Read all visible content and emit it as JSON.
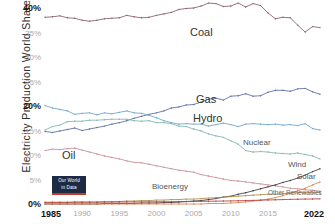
{
  "axes": {
    "ytitle": "Electricity Production World Share",
    "yticks": [
      {
        "label": "40%",
        "value": 40,
        "strong": true
      },
      {
        "label": "35%",
        "value": 35,
        "strong": false
      },
      {
        "label": "30%",
        "value": 30,
        "strong": false
      },
      {
        "label": "25%",
        "value": 25,
        "strong": false
      },
      {
        "label": "20%",
        "value": 20,
        "strong": true
      },
      {
        "label": "15%",
        "value": 15,
        "strong": false
      },
      {
        "label": "10%",
        "value": 10,
        "strong": false
      },
      {
        "label": "5%",
        "value": 5,
        "strong": false
      },
      {
        "label": "0%",
        "value": 0,
        "strong": true
      }
    ],
    "xticks": [
      {
        "label": "1985",
        "value": 1985,
        "strong": true
      },
      {
        "label": "1990",
        "value": 1990,
        "strong": false
      },
      {
        "label": "1995",
        "value": 1995,
        "strong": false
      },
      {
        "label": "2000",
        "value": 2000,
        "strong": false
      },
      {
        "label": "2005",
        "value": 2005,
        "strong": false
      },
      {
        "label": "2010",
        "value": 2010,
        "strong": false
      },
      {
        "label": "2015",
        "value": 2015,
        "strong": false
      },
      {
        "label": "2022",
        "value": 2022,
        "strong": true
      }
    ]
  },
  "badge": {
    "line1": "Our World",
    "line2": "in Data"
  },
  "labels": {
    "coal": "Coal",
    "gas": "Gas",
    "hydro": "Hydro",
    "nuclear": "Nuclear",
    "oil": "Oil",
    "wind": "Wind",
    "solar": "Solar",
    "bioenergy": "Bioenergy",
    "other": "Other Renewables"
  },
  "chart_data": {
    "type": "line",
    "title": "",
    "xlabel": "",
    "ylabel": "Electricity Production World Share",
    "xlim": [
      1985,
      2022
    ],
    "ylim": [
      0,
      40
    ],
    "grid": false,
    "legend": "inline-series-labels",
    "x": [
      1985,
      1986,
      1987,
      1988,
      1989,
      1990,
      1991,
      1992,
      1993,
      1994,
      1995,
      1996,
      1997,
      1998,
      1999,
      2000,
      2001,
      2002,
      2003,
      2004,
      2005,
      2006,
      2007,
      2008,
      2009,
      2010,
      2011,
      2012,
      2013,
      2014,
      2015,
      2016,
      2017,
      2018,
      2019,
      2020,
      2021,
      2022
    ],
    "series": [
      {
        "name": "Coal",
        "color": "#8a5a6b",
        "values": [
          38.1,
          38.2,
          38.4,
          38.0,
          37.9,
          37.5,
          37.3,
          37.5,
          37.8,
          37.9,
          38.0,
          38.5,
          38.2,
          38.0,
          38.1,
          38.5,
          38.8,
          39.1,
          39.7,
          39.9,
          40.0,
          40.4,
          41.0,
          40.9,
          40.3,
          40.4,
          41.0,
          40.2,
          40.9,
          40.5,
          39.0,
          37.8,
          38.1,
          38.0,
          36.5,
          35.1,
          36.2,
          36.0
        ]
      },
      {
        "name": "Gas",
        "color": "#5a6aa0",
        "values": [
          14.8,
          14.6,
          14.9,
          15.2,
          15.5,
          15.0,
          15.3,
          15.6,
          15.9,
          16.3,
          16.6,
          17.0,
          17.5,
          17.9,
          18.3,
          18.6,
          19.0,
          19.6,
          19.8,
          20.2,
          20.3,
          20.8,
          21.4,
          21.6,
          21.2,
          22.0,
          22.1,
          22.5,
          22.0,
          22.1,
          22.8,
          23.2,
          23.2,
          23.0,
          23.5,
          23.6,
          22.9,
          22.4
        ]
      },
      {
        "name": "Hydro",
        "color": "#6aa3cc",
        "values": [
          20.1,
          19.6,
          19.3,
          19.0,
          18.3,
          18.5,
          18.6,
          18.2,
          18.6,
          18.4,
          18.7,
          19.0,
          18.6,
          18.5,
          18.1,
          17.6,
          17.0,
          16.6,
          16.3,
          16.4,
          16.3,
          16.3,
          15.9,
          16.2,
          16.5,
          16.2,
          15.8,
          16.3,
          16.4,
          16.3,
          16.2,
          16.3,
          16.1,
          16.2,
          16.0,
          16.4,
          15.4,
          15.1
        ]
      },
      {
        "name": "Nuclear",
        "color": "#7fb3b0",
        "values": [
          15.1,
          15.8,
          16.1,
          16.8,
          16.9,
          16.9,
          17.1,
          17.1,
          17.2,
          17.3,
          17.3,
          17.3,
          17.0,
          16.9,
          17.0,
          16.6,
          16.6,
          16.4,
          15.9,
          15.8,
          15.3,
          14.9,
          14.3,
          13.9,
          13.6,
          12.9,
          12.2,
          10.9,
          10.6,
          10.7,
          10.6,
          10.4,
          10.3,
          10.2,
          10.4,
          10.1,
          9.8,
          9.2
        ]
      },
      {
        "name": "Oil",
        "color": "#c98a93",
        "values": [
          10.9,
          11.2,
          11.1,
          11.3,
          11.4,
          11.0,
          10.6,
          10.2,
          9.8,
          9.5,
          9.2,
          8.8,
          8.5,
          8.4,
          8.1,
          7.8,
          7.5,
          7.2,
          6.9,
          6.7,
          6.5,
          6.0,
          5.7,
          5.4,
          5.1,
          4.8,
          4.7,
          4.5,
          4.3,
          4.1,
          3.9,
          3.7,
          3.5,
          3.2,
          3.1,
          2.9,
          2.8,
          2.6
        ]
      },
      {
        "name": "Wind",
        "color": "#3b3b3b",
        "values": [
          0.0,
          0.0,
          0.0,
          0.0,
          0.0,
          0.0,
          0.0,
          0.0,
          0.1,
          0.1,
          0.1,
          0.1,
          0.1,
          0.2,
          0.2,
          0.2,
          0.3,
          0.3,
          0.4,
          0.5,
          0.6,
          0.7,
          0.9,
          1.1,
          1.4,
          1.6,
          2.0,
          2.3,
          2.7,
          3.1,
          3.5,
          3.9,
          4.4,
          4.8,
          5.3,
          5.9,
          6.6,
          7.2
        ]
      },
      {
        "name": "Solar",
        "color": "#d9834f",
        "values": [
          0.0,
          0.0,
          0.0,
          0.0,
          0.0,
          0.0,
          0.0,
          0.0,
          0.0,
          0.0,
          0.0,
          0.0,
          0.0,
          0.0,
          0.0,
          0.0,
          0.0,
          0.0,
          0.0,
          0.0,
          0.0,
          0.0,
          0.1,
          0.1,
          0.1,
          0.2,
          0.3,
          0.4,
          0.6,
          0.8,
          1.0,
          1.3,
          1.7,
          2.2,
          2.7,
          3.2,
          3.9,
          4.5
        ]
      },
      {
        "name": "Bioenergy",
        "color": "#b08a4a",
        "values": [
          0.3,
          0.3,
          0.3,
          0.3,
          0.4,
          0.4,
          0.4,
          0.4,
          0.5,
          0.5,
          0.5,
          0.6,
          0.6,
          0.7,
          0.7,
          0.8,
          0.8,
          0.9,
          0.9,
          1.0,
          1.0,
          1.1,
          1.2,
          1.3,
          1.4,
          1.5,
          1.6,
          1.7,
          1.8,
          1.9,
          2.0,
          2.0,
          2.1,
          2.2,
          2.3,
          2.3,
          2.3,
          2.3
        ]
      },
      {
        "name": "Other Renewables",
        "color": "#b4403f",
        "values": [
          0.35,
          0.35,
          0.35,
          0.36,
          0.36,
          0.37,
          0.37,
          0.38,
          0.38,
          0.39,
          0.4,
          0.41,
          0.42,
          0.43,
          0.44,
          0.45,
          0.46,
          0.47,
          0.48,
          0.5,
          0.52,
          0.54,
          0.56,
          0.58,
          0.6,
          0.63,
          0.66,
          0.7,
          0.74,
          0.78,
          0.82,
          0.86,
          0.9,
          0.94,
          0.98,
          1.0,
          1.02,
          1.05
        ]
      }
    ]
  }
}
